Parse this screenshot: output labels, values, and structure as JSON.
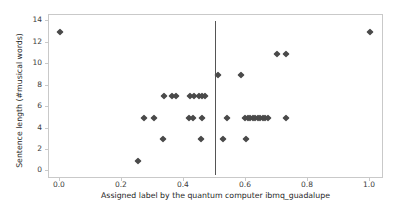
{
  "chart_data": {
    "type": "scatter",
    "title": "",
    "xlabel": "Assigned label by the quantum computer ibmq_guadalupe",
    "ylabel": "Sentence length (#musical words)",
    "xlim": [
      -0.035,
      1.045
    ],
    "ylim": [
      -0.7,
      14.6
    ],
    "xticks": [
      0.0,
      0.2,
      0.4,
      0.6,
      0.8,
      1.0
    ],
    "xtick_labels": [
      "0.0",
      "0.2",
      "0.4",
      "0.6",
      "0.8",
      "1.0"
    ],
    "yticks": [
      0,
      2,
      4,
      6,
      8,
      10,
      12,
      14
    ],
    "ytick_labels": [
      "0",
      "2",
      "4",
      "6",
      "8",
      "10",
      "12",
      "14"
    ],
    "grid": false,
    "legend": null,
    "marker": "diamond",
    "marker_color": "#4a4a4a",
    "frame_color": "#c9c9c9",
    "annotations": [
      {
        "name": "decision-threshold",
        "type": "vline",
        "x": 0.5,
        "y_from": -0.35,
        "y_to": 14.0,
        "color": "#555555"
      }
    ],
    "series": [
      {
        "name": "sentences",
        "points": [
          [
            0.0,
            13
          ],
          [
            1.0,
            13
          ],
          [
            0.7,
            11
          ],
          [
            0.73,
            11
          ],
          [
            0.51,
            9
          ],
          [
            0.585,
            9
          ],
          [
            0.335,
            7
          ],
          [
            0.363,
            7
          ],
          [
            0.375,
            7
          ],
          [
            0.418,
            7
          ],
          [
            0.432,
            7
          ],
          [
            0.447,
            7
          ],
          [
            0.458,
            7
          ],
          [
            0.468,
            7
          ],
          [
            0.272,
            5
          ],
          [
            0.305,
            5
          ],
          [
            0.417,
            5
          ],
          [
            0.428,
            5
          ],
          [
            0.458,
            5
          ],
          [
            0.538,
            5
          ],
          [
            0.597,
            5
          ],
          [
            0.606,
            5
          ],
          [
            0.614,
            5
          ],
          [
            0.622,
            5
          ],
          [
            0.63,
            5
          ],
          [
            0.638,
            5
          ],
          [
            0.646,
            5
          ],
          [
            0.654,
            5
          ],
          [
            0.662,
            5
          ],
          [
            0.67,
            5
          ],
          [
            0.73,
            5
          ],
          [
            0.333,
            3
          ],
          [
            0.455,
            3
          ],
          [
            0.525,
            3
          ],
          [
            0.6,
            3
          ],
          [
            0.253,
            1
          ]
        ]
      }
    ]
  }
}
